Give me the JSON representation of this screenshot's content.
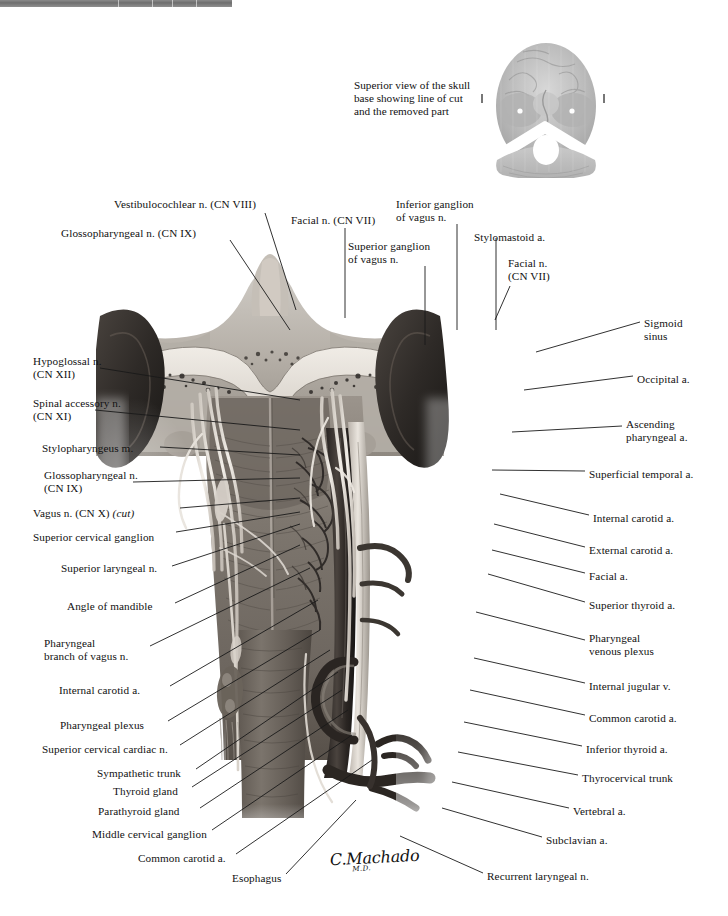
{
  "plate": {
    "title": "Pharynx: posterior view with cranial nerves and vessels",
    "signature": "C.Machado",
    "signature_suffix": "M.D."
  },
  "inset": {
    "caption": "Superior view of the skull base showing line of cut and the removed part",
    "image_name": "skull-base-superior-view"
  },
  "labels_top": [
    {
      "name": "vestibulocochlear-nerve",
      "text": "Vestibulocochlear n. (CN VIII)",
      "x": 114,
      "y": 198,
      "align": "left"
    },
    {
      "name": "glossopharyngeal-nerve-top",
      "text": "Glossopharyngeal n. (CN IX)",
      "x": 61,
      "y": 227,
      "align": "left"
    },
    {
      "name": "facial-nerve-top",
      "text": "Facial n. (CN VII)",
      "x": 291,
      "y": 214,
      "align": "left"
    },
    {
      "name": "inferior-ganglion-of-vagus",
      "text": "Inferior ganglion\nof vagus n.",
      "x": 396,
      "y": 198,
      "align": "left"
    },
    {
      "name": "superior-ganglion-of-vagus",
      "text": "Superior ganglion\nof vagus n.",
      "x": 348,
      "y": 240,
      "align": "left"
    },
    {
      "name": "stylomastoid-artery",
      "text": "Stylomastoid a.",
      "x": 474,
      "y": 231,
      "align": "left"
    },
    {
      "name": "facial-nerve-right",
      "text": "Facial n.\n(CN VII)",
      "x": 508,
      "y": 257,
      "align": "left"
    }
  ],
  "labels_left": [
    {
      "name": "hypoglossal-nerve",
      "text": "Hypoglossal n.\n(CN XII)",
      "x": 33,
      "y": 355,
      "align": "left"
    },
    {
      "name": "spinal-accessory-nerve",
      "text": "Spinal accessory n.\n(CN XI)",
      "x": 33,
      "y": 397,
      "align": "left"
    },
    {
      "name": "stylopharyngeus-muscle",
      "text": "Stylopharyngeus m.",
      "x": 42,
      "y": 442,
      "align": "left"
    },
    {
      "name": "glossopharyngeal-nerve-left",
      "text": "Glossopharyngeal n.\n(CN IX)",
      "x": 44,
      "y": 469,
      "align": "left"
    },
    {
      "name": "vagus-nerve-cut",
      "text": "Vagus n. (CN X) ",
      "text_italic": "(cut)",
      "x": 33,
      "y": 507,
      "align": "left"
    },
    {
      "name": "superior-cervical-ganglion",
      "text": "Superior cervical ganglion",
      "x": 33,
      "y": 531,
      "align": "left"
    },
    {
      "name": "superior-laryngeal-nerve",
      "text": "Superior laryngeal n.",
      "x": 61,
      "y": 562,
      "align": "left"
    },
    {
      "name": "angle-of-mandible",
      "text": "Angle of mandible",
      "x": 67,
      "y": 600,
      "align": "left"
    },
    {
      "name": "pharyngeal-branch-of-vagus",
      "text": "Pharyngeal\nbranch of vagus n.",
      "x": 44,
      "y": 637,
      "align": "left"
    },
    {
      "name": "internal-carotid-artery-left",
      "text": "Internal carotid a.",
      "x": 59,
      "y": 684,
      "align": "left"
    },
    {
      "name": "pharyngeal-plexus",
      "text": "Pharyngeal plexus",
      "x": 60,
      "y": 719,
      "align": "left"
    },
    {
      "name": "superior-cervical-cardiac-nerve",
      "text": "Superior cervical cardiac n.",
      "x": 42,
      "y": 743,
      "align": "left"
    },
    {
      "name": "sympathetic-trunk",
      "text": "Sympathetic trunk",
      "x": 97,
      "y": 767,
      "align": "left"
    },
    {
      "name": "thyroid-gland",
      "text": "Thyroid gland",
      "x": 113,
      "y": 785,
      "align": "left"
    },
    {
      "name": "parathyroid-gland",
      "text": "Parathyroid gland",
      "x": 98,
      "y": 805,
      "align": "left"
    },
    {
      "name": "middle-cervical-ganglion",
      "text": "Middle cervical ganglion",
      "x": 92,
      "y": 828,
      "align": "left"
    },
    {
      "name": "common-carotid-artery-left",
      "text": "Common carotid a.",
      "x": 138,
      "y": 852,
      "align": "left"
    },
    {
      "name": "esophagus",
      "text": "Esophagus",
      "x": 232,
      "y": 872,
      "align": "left"
    }
  ],
  "labels_right": [
    {
      "name": "sigmoid-sinus",
      "text": "Sigmoid\nsinus",
      "x": 644,
      "y": 317,
      "align": "left"
    },
    {
      "name": "occipital-artery",
      "text": "Occipital a.",
      "x": 637,
      "y": 373,
      "align": "left"
    },
    {
      "name": "ascending-pharyngeal-artery",
      "text": "Ascending\npharyngeal a.",
      "x": 626,
      "y": 418,
      "align": "left"
    },
    {
      "name": "superficial-temporal-artery",
      "text": "Superficial temporal a.",
      "x": 589,
      "y": 468,
      "align": "left"
    },
    {
      "name": "internal-carotid-artery-right",
      "text": "Internal carotid a.",
      "x": 593,
      "y": 512,
      "align": "left"
    },
    {
      "name": "external-carotid-artery",
      "text": "External carotid a.",
      "x": 589,
      "y": 544,
      "align": "left"
    },
    {
      "name": "facial-artery",
      "text": "Facial a.",
      "x": 589,
      "y": 570,
      "align": "left"
    },
    {
      "name": "superior-thyroid-artery",
      "text": "Superior thyroid a.",
      "x": 589,
      "y": 599,
      "align": "left"
    },
    {
      "name": "pharyngeal-venous-plexus",
      "text": "Pharyngeal\nvenous plexus",
      "x": 589,
      "y": 632,
      "align": "left"
    },
    {
      "name": "internal-jugular-vein",
      "text": "Internal jugular v.",
      "x": 589,
      "y": 680,
      "align": "left"
    },
    {
      "name": "common-carotid-artery-right",
      "text": "Common carotid a.",
      "x": 589,
      "y": 712,
      "align": "left"
    },
    {
      "name": "inferior-thyroid-artery",
      "text": "Inferior thyroid a.",
      "x": 586,
      "y": 743,
      "align": "left"
    },
    {
      "name": "thyrocervical-trunk",
      "text": "Thyrocervical trunk",
      "x": 582,
      "y": 772,
      "align": "left"
    },
    {
      "name": "vertebral-artery",
      "text": "Vertebral a.",
      "x": 573,
      "y": 805,
      "align": "left"
    },
    {
      "name": "subclavian-artery",
      "text": "Subclavian a.",
      "x": 546,
      "y": 834,
      "align": "left"
    },
    {
      "name": "recurrent-laryngeal-nerve",
      "text": "Recurrent laryngeal n.",
      "x": 487,
      "y": 870,
      "align": "left"
    }
  ],
  "colors": {
    "ink": "#111111",
    "leader": "#1a1a1a",
    "bar": "#7c7c7c",
    "paper": "#ffffff"
  }
}
